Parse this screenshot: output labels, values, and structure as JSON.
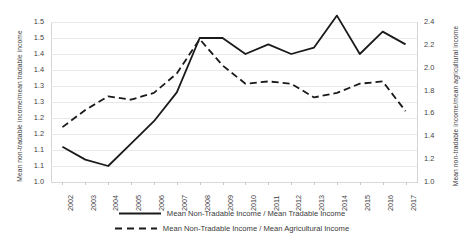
{
  "chart_data": {
    "type": "line",
    "title": "",
    "xlabel": "",
    "grid": true,
    "legend_position": "bottom",
    "categories": [
      "2002",
      "2003",
      "2004",
      "2005",
      "2006",
      "2007",
      "2008",
      "2009",
      "2010",
      "2011",
      "2012",
      "2013",
      "2014",
      "2015",
      "2016",
      "2017"
    ],
    "axes": {
      "left": {
        "label": "Mean non-tradable income/mean tradable income",
        "lim": [
          1.0,
          1.5
        ],
        "tick_step": 0.05,
        "ticks": [
          1.0,
          1.05,
          1.1,
          1.15,
          1.2,
          1.25,
          1.3,
          1.35,
          1.4,
          1.45,
          1.5
        ],
        "tick_labels": [
          "1.0",
          "1.1",
          "1.1",
          "1.2",
          "1.2",
          "1.3",
          "1.3",
          "1.4",
          "1.4",
          "1.5",
          "1.5"
        ]
      },
      "right": {
        "label": "Mean non-tradable income/mean agricultural income",
        "lim": [
          1.0,
          2.4
        ],
        "tick_step": 0.2,
        "ticks": [
          1.0,
          1.2,
          1.4,
          1.6,
          1.8,
          2.0,
          2.2,
          2.4
        ],
        "tick_labels": [
          "1.0",
          "1.2",
          "1.4",
          "1.6",
          "1.8",
          "2.0",
          "2.2",
          "2.4"
        ]
      }
    },
    "series": [
      {
        "name": "Mean Non-Tradable Income / Mean Tradable Income",
        "axis": "left",
        "style": "solid",
        "color": "#1a1a1a",
        "values": [
          1.11,
          1.07,
          1.05,
          1.12,
          1.19,
          1.28,
          1.45,
          1.45,
          1.4,
          1.43,
          1.4,
          1.42,
          1.52,
          1.4,
          1.47,
          1.43
        ]
      },
      {
        "name": "Mean Non-Tradable Income / Mean Agricultural Income",
        "axis": "right",
        "style": "dashed",
        "color": "#1a1a1a",
        "values": [
          1.48,
          1.63,
          1.75,
          1.72,
          1.78,
          1.95,
          2.25,
          2.02,
          1.86,
          1.88,
          1.86,
          1.74,
          1.78,
          1.86,
          1.88,
          1.62
        ]
      }
    ]
  }
}
